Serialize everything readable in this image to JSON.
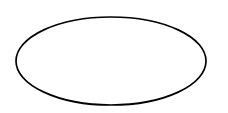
{
  "diagram": {
    "background": "#ffffff",
    "shapes": [
      {
        "type": "ellipse",
        "label": "",
        "cx": 111,
        "cy": 61,
        "rx": 95,
        "ry": 44,
        "stroke": "#000000",
        "stroke_width": 1.7,
        "fill": "#ffffff"
      }
    ]
  }
}
